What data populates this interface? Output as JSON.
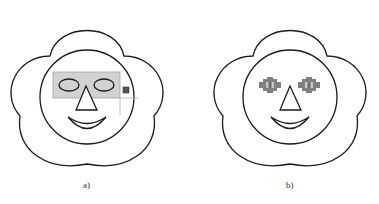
{
  "figures": [
    {
      "id": "a",
      "caption": "a)",
      "description": "Smiley face inside flower with eyes selected by a gray selection rectangle and a resize handle",
      "selection_fill": "#d2d2d2",
      "selection_stroke": "#a0a0a0",
      "handle_color": "#555555"
    },
    {
      "id": "b",
      "caption": "b)",
      "description": "Smiley face inside flower with eyes shown as gray pixelated/rasterized shapes",
      "eye_color": "#808080"
    }
  ],
  "colors": {
    "line": "#1a1a1a",
    "background": "#ffffff"
  }
}
